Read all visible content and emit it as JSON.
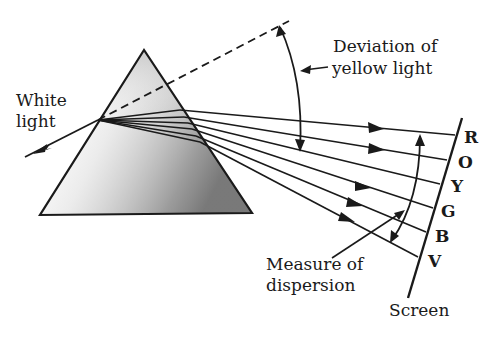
{
  "diagram": {
    "labels": {
      "white_light_line1": "White",
      "white_light_line2": "light",
      "deviation_line1": "Deviation of",
      "deviation_line2": "yellow light",
      "dispersion_line1": "Measure of",
      "dispersion_line2": "dispersion",
      "screen": "Screen"
    },
    "spectrum": [
      {
        "letter": "R",
        "name": "Red"
      },
      {
        "letter": "O",
        "name": "Orange"
      },
      {
        "letter": "Y",
        "name": "Yellow"
      },
      {
        "letter": "G",
        "name": "Green"
      },
      {
        "letter": "B",
        "name": "Blue"
      },
      {
        "letter": "V",
        "name": "Violet"
      }
    ],
    "colors": {
      "ink": "#1a1a1a",
      "prism_shade": "#9a9a9a",
      "background": "#ffffff"
    }
  }
}
